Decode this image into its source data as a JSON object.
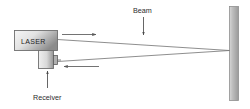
{
  "figure": {
    "title_text": "",
    "background_color": "#ffffff",
    "line_color": "#6b6b6b",
    "text_color": "#2b2b2b"
  },
  "labels": {
    "laser": "LASER",
    "receiver": "Receiver",
    "beam": "Beam"
  },
  "components": {
    "laser_body": {
      "name": "laser-emitter-housing",
      "fill_start": "#f2f2f2",
      "fill_end": "#8e8e8e",
      "stroke": "#6f6f6f"
    },
    "receiver_body": {
      "name": "receiver-housing",
      "fill_start": "#ededed",
      "fill_end": "#9a9a9a",
      "stroke": "#6f6f6f"
    },
    "receiver_aperture": {
      "name": "receiver-aperture",
      "fill": "#b4b4b4",
      "stroke": "#5f5f5f"
    },
    "target_wall": {
      "name": "target-surface",
      "fill_start": "#cfcfcf",
      "fill_end": "#9d9d9d",
      "stroke": "#8a8a8a"
    }
  },
  "annotations": {
    "outgoing_beam_arrow": "arrow-right-outgoing",
    "returning_beam_arrow": "arrow-left-returning",
    "beam_pointer_arrow": "arrow-down-beam",
    "receiver_pointer_arrow": "arrow-up-receiver"
  }
}
